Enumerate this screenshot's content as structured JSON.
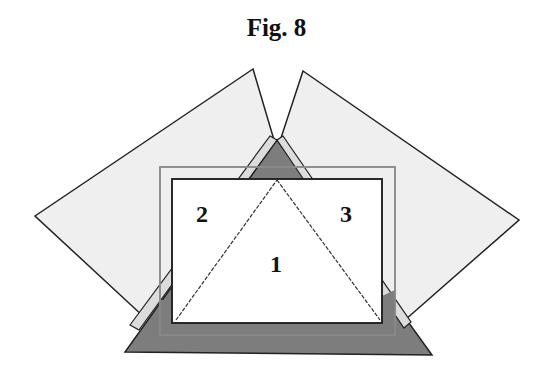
{
  "figure": {
    "title": "Fig. 8",
    "labels": {
      "center": "1",
      "left": "2",
      "right": "3"
    }
  },
  "colors": {
    "background": "#ffffff",
    "light_panel": "#efefef",
    "dark_triangle": "#7d7d7d",
    "frame_gray": "#9a9a9a",
    "stroke": "#222222",
    "inner_rect": "#ffffff"
  }
}
